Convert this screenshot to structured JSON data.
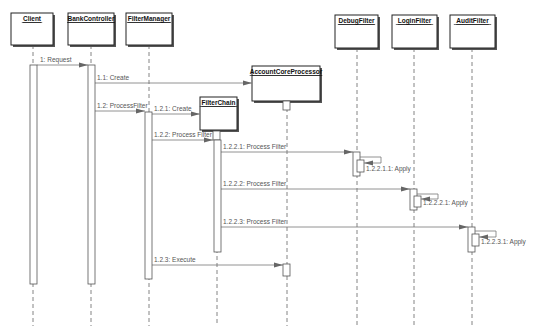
{
  "diagram": {
    "type": "UML sequence diagram",
    "objects": [
      {
        "id": "client",
        "label": "Client",
        "box": [
          11,
          13,
          42,
          32
        ],
        "lifeline_x": 33
      },
      {
        "id": "bankcontroller",
        "label": "BankController",
        "box": [
          68,
          13,
          46,
          32
        ],
        "lifeline_x": 91
      },
      {
        "id": "filtermanager",
        "label": "FilterManager",
        "box": [
          126,
          13,
          46,
          32
        ],
        "lifeline_x": 149
      },
      {
        "id": "accountcoreprocessor",
        "label": "AccountCoreProcessor",
        "box": [
          252,
          66,
          68,
          35
        ],
        "lifeline_x": 287
      },
      {
        "id": "filterchain",
        "label": "FilterChain",
        "box": [
          200,
          97,
          37,
          33
        ],
        "lifeline_x": 217
      },
      {
        "id": "debugfilter",
        "label": "DebugFilter",
        "box": [
          335,
          15,
          43,
          33
        ],
        "lifeline_x": 357
      },
      {
        "id": "loginfilter",
        "label": "LoginFilter",
        "box": [
          392,
          15,
          45,
          33
        ],
        "lifeline_x": 414
      },
      {
        "id": "auditfilter",
        "label": "AuditFilter",
        "box": [
          450,
          15,
          45,
          33
        ],
        "lifeline_x": 472
      }
    ],
    "lifeline_end_y": 326,
    "activations": [
      {
        "object": "client",
        "x": 30,
        "y1": 65,
        "y2": 284
      },
      {
        "object": "bankcontroller",
        "x": 88,
        "y1": 65,
        "y2": 284
      },
      {
        "object": "filtermanager",
        "x": 145,
        "y1": 112,
        "y2": 279
      },
      {
        "object": "accountcoreprocessor",
        "x": 283,
        "y1": 101,
        "y2": 110
      },
      {
        "object": "filterchain",
        "x": 213,
        "y1": 131,
        "y2": 140
      },
      {
        "object": "filterchain",
        "x": 214,
        "y1": 140,
        "y2": 252
      },
      {
        "object": "debugfilter",
        "x": 353,
        "y1": 152,
        "y2": 176
      },
      {
        "object": "debugfilter",
        "x": 357,
        "y1": 160,
        "y2": 172
      },
      {
        "object": "loginfilter",
        "x": 410,
        "y1": 189,
        "y2": 210
      },
      {
        "object": "loginfilter",
        "x": 414,
        "y1": 196,
        "y2": 207
      },
      {
        "object": "auditfilter",
        "x": 468,
        "y1": 227,
        "y2": 252
      },
      {
        "object": "auditfilter",
        "x": 472,
        "y1": 234,
        "y2": 246
      },
      {
        "object": "accountcoreprocessor",
        "x": 283,
        "y1": 264,
        "y2": 276
      }
    ],
    "messages": [
      {
        "label": "1: Request",
        "from_x": 37,
        "to_x": 88,
        "y": 65,
        "label_x": 40,
        "label_y": 62
      },
      {
        "label": "1.1: Create",
        "from_x": 95,
        "to_x": 252,
        "y": 83,
        "label_x": 97,
        "label_y": 80
      },
      {
        "label": "1.2: ProcessFilter",
        "from_x": 95,
        "to_x": 145,
        "y": 111,
        "label_x": 97,
        "label_y": 108
      },
      {
        "label": "1.2.1: Create",
        "from_x": 152,
        "to_x": 200,
        "y": 114,
        "label_x": 154,
        "label_y": 111
      },
      {
        "label": "1.2.2: Process Filter",
        "from_x": 152,
        "to_x": 213,
        "y": 140,
        "label_x": 154,
        "label_y": 137
      },
      {
        "label": "1.2.2.1: Process Filter",
        "from_x": 221,
        "to_x": 353,
        "y": 152,
        "label_x": 223,
        "label_y": 149
      },
      {
        "label": "1.2.2.2: Process Filter",
        "from_x": 221,
        "to_x": 410,
        "y": 189,
        "label_x": 223,
        "label_y": 186
      },
      {
        "label": "1.2.2.3: Process Filter",
        "from_x": 221,
        "to_x": 468,
        "y": 227,
        "label_x": 223,
        "label_y": 224
      },
      {
        "label": "1.2.3: Execute",
        "from_x": 152,
        "to_x": 283,
        "y": 265,
        "label_x": 154,
        "label_y": 262
      }
    ],
    "self_calls": [
      {
        "label": "1.2.2.1.1: Apply",
        "x": 360,
        "y_out": 157,
        "y_in": 163,
        "loop_x": 381,
        "label_x": 366,
        "label_y": 171
      },
      {
        "label": "1.2.2.2.1: Apply",
        "x": 417,
        "y_out": 194,
        "y_in": 199,
        "loop_x": 438,
        "label_x": 423,
        "label_y": 205
      },
      {
        "label": "1.2.2.3.1: Apply",
        "x": 475,
        "y_out": 231,
        "y_in": 237,
        "loop_x": 496,
        "label_x": 481,
        "label_y": 244
      }
    ],
    "activation_width": 7
  }
}
